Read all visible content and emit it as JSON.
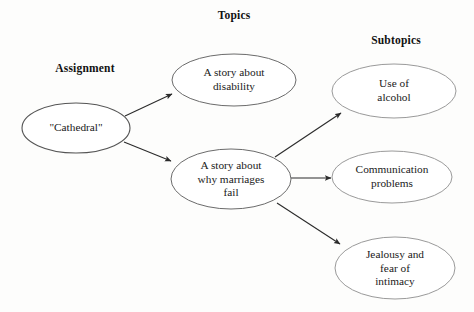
{
  "diagram": {
    "kind": "concept-map",
    "title_visible": false,
    "background_color": "#fdfdfc",
    "column_headers": [
      {
        "id": "assignment",
        "label": "Assignment",
        "cx": 85,
        "cy": 70
      },
      {
        "id": "topics",
        "label": "Topics",
        "cx": 234,
        "cy": 17
      },
      {
        "id": "subtopics",
        "label": "Subtopics",
        "cx": 396,
        "cy": 42
      }
    ],
    "nodes": [
      {
        "id": "cathedral",
        "label": "\"Cathedral\"",
        "level": "assignment",
        "cx": 76,
        "cy": 128,
        "rx": 54,
        "ry": 25,
        "stroke": "#555555",
        "stroke_width": 1.1,
        "fill": "#ffffff"
      },
      {
        "id": "story-disability",
        "label": "A story about\ndisability",
        "level": "topic",
        "cx": 234,
        "cy": 80,
        "rx": 62,
        "ry": 26,
        "stroke": "#6b6b6b",
        "stroke_width": 1.0,
        "fill": "#ffffff"
      },
      {
        "id": "story-marriages",
        "label": "A story about\nwhy marriages\nfail",
        "level": "topic",
        "cx": 231,
        "cy": 179,
        "rx": 60,
        "ry": 30,
        "stroke": "#6b6b6b",
        "stroke_width": 1.0,
        "fill": "#ffffff"
      },
      {
        "id": "use-of-alcohol",
        "label": "Use of\nalcohol",
        "level": "subtopic",
        "cx": 394,
        "cy": 91,
        "rx": 62,
        "ry": 27,
        "stroke": "#9a9a9a",
        "stroke_width": 1.0,
        "fill": "#ffffff"
      },
      {
        "id": "communication-problems",
        "label": "Communication\nproblems",
        "level": "subtopic",
        "cx": 392,
        "cy": 177,
        "rx": 60,
        "ry": 26,
        "stroke": "#9a9a9a",
        "stroke_width": 1.0,
        "fill": "#ffffff"
      },
      {
        "id": "jealousy-intimacy",
        "label": "Jealousy and\nfear of\nintimacy",
        "level": "subtopic",
        "cx": 395,
        "cy": 268,
        "rx": 60,
        "ry": 31,
        "stroke": "#9a9a9a",
        "stroke_width": 1.0,
        "fill": "#ffffff"
      }
    ],
    "edges": [
      {
        "id": "cathedral-to-disability",
        "from": "cathedral",
        "to": "story-disability",
        "x1": 125,
        "y1": 116,
        "x2": 172,
        "y2": 94,
        "stroke": "#2b2b2b"
      },
      {
        "id": "cathedral-to-marriages",
        "from": "cathedral",
        "to": "story-marriages",
        "x1": 124,
        "y1": 142,
        "x2": 171,
        "y2": 161,
        "stroke": "#2b2b2b"
      },
      {
        "id": "marriages-to-alcohol",
        "from": "story-marriages",
        "to": "use-of-alcohol",
        "x1": 275,
        "y1": 157,
        "x2": 341,
        "y2": 113,
        "stroke": "#2b2b2b"
      },
      {
        "id": "marriages-to-communication",
        "from": "story-marriages",
        "to": "communication-problems",
        "x1": 291,
        "y1": 178,
        "x2": 331,
        "y2": 178,
        "stroke": "#2b2b2b"
      },
      {
        "id": "marriages-to-jealousy",
        "from": "story-marriages",
        "to": "jealousy-intimacy",
        "x1": 277,
        "y1": 203,
        "x2": 340,
        "y2": 244,
        "stroke": "#2b2b2b"
      }
    ]
  }
}
